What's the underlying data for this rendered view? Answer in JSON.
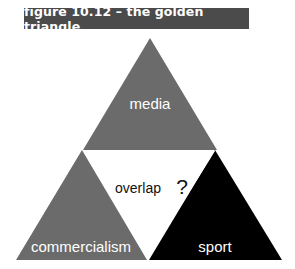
{
  "figure": {
    "title": "figure 10.12 – the golden triangle"
  },
  "diagram": {
    "type": "triangle-of-triangles",
    "nodes": [
      {
        "id": "media",
        "label": "media",
        "position": "top",
        "fill": "#6b6b6b",
        "text_color": "#ffffff"
      },
      {
        "id": "commercialism",
        "label": "commercialism",
        "position": "bottom-left",
        "fill": "#6b6b6b",
        "text_color": "#ffffff"
      },
      {
        "id": "sport",
        "label": "sport",
        "position": "bottom-right",
        "fill": "#000000",
        "text_color": "#ffffff"
      },
      {
        "id": "overlap",
        "label": "overlap",
        "position": "center",
        "fill": "#ffffff",
        "text_color": "#111111",
        "suffix": "?"
      }
    ]
  },
  "colors": {
    "title_bg": "#4b4b4b",
    "gray_triangle": "#6b6b6b",
    "black_triangle": "#000000",
    "background": "#ffffff"
  }
}
